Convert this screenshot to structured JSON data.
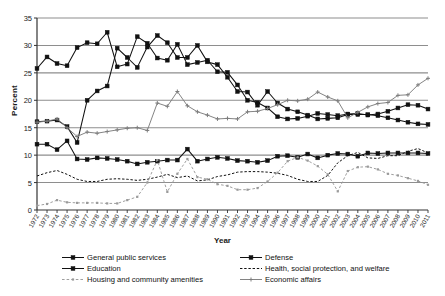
{
  "chart_data": {
    "type": "line",
    "title": "",
    "xlabel": "Year",
    "ylabel": "Percent",
    "ylim": [
      0,
      35
    ],
    "ytick_step": 5,
    "yticks": [
      0,
      5,
      10,
      15,
      20,
      25,
      30,
      35
    ],
    "grid": true,
    "grid_axis": "y",
    "legend_position": "bottom",
    "legend_columns": 2,
    "x": [
      1972,
      1973,
      1974,
      1975,
      1976,
      1977,
      1978,
      1979,
      1980,
      1981,
      1982,
      1983,
      1984,
      1985,
      1986,
      1987,
      1988,
      1989,
      1990,
      1991,
      1992,
      1993,
      1994,
      1995,
      1996,
      1997,
      1998,
      1999,
      2000,
      2001,
      2002,
      2003,
      2004,
      2005,
      2006,
      2007,
      2008,
      2009,
      2010,
      2011
    ],
    "categories": [
      "1972",
      "1973",
      "1974",
      "1975",
      "1976",
      "1977",
      "1978",
      "1979",
      "1980",
      "1981",
      "1982",
      "1983",
      "1984",
      "1985",
      "1986",
      "1987",
      "1988",
      "1989",
      "1990",
      "1991",
      "1992",
      "1993",
      "1994",
      "1995",
      "1996",
      "1997",
      "1998",
      "1999",
      "2000",
      "2001",
      "2002",
      "2003",
      "2004",
      "2005",
      "2006",
      "2007",
      "2008",
      "2009",
      "2010",
      "2011"
    ],
    "series": [
      {
        "name": "General public services",
        "marker": "square",
        "line": "solid",
        "color": "#111111",
        "values": [
          12.0,
          12.0,
          11.0,
          12.6,
          9.3,
          9.2,
          9.5,
          9.4,
          9.2,
          8.9,
          8.4,
          8.7,
          8.9,
          9.1,
          9.1,
          11.1,
          8.9,
          9.3,
          9.6,
          9.4,
          9.0,
          8.9,
          8.7,
          9.0,
          9.8,
          9.9,
          9.6,
          10.2,
          9.5,
          10.0,
          10.3,
          10.2,
          9.8,
          10.4,
          10.3,
          10.4,
          10.4,
          10.4,
          10.4,
          10.3
        ]
      },
      {
        "name": "Defense",
        "marker": "square",
        "line": "solid",
        "color": "#111111",
        "values": [
          25.8,
          27.9,
          26.7,
          26.3,
          29.6,
          30.5,
          30.3,
          32.4,
          26.1,
          26.6,
          31.6,
          30.4,
          27.7,
          27.3,
          30.2,
          26.5,
          26.9,
          27.3,
          25.2,
          25.1,
          22.8,
          20.0,
          19.6,
          18.6,
          17.0,
          16.6,
          16.7,
          17.1,
          17.6,
          17.4,
          17.2,
          17.5,
          17.6,
          17.3,
          17.5,
          18.0,
          18.6,
          19.2,
          19.1,
          18.4
        ]
      },
      {
        "name": "Education",
        "marker": "square",
        "line": "solid",
        "color": "#111111",
        "values": [
          16.1,
          16.2,
          16.4,
          15.2,
          12.3,
          20.0,
          21.7,
          22.6,
          29.5,
          27.8,
          26.0,
          29.7,
          31.8,
          30.5,
          27.8,
          27.8,
          30.0,
          27.0,
          26.5,
          24.2,
          21.6,
          21.5,
          19.1,
          21.6,
          19.5,
          18.4,
          17.9,
          17.3,
          16.6,
          16.7,
          16.8,
          17.4,
          17.4,
          17.4,
          17.2,
          16.8,
          16.4,
          16.0,
          15.7,
          15.6
        ]
      },
      {
        "name": "Health, social protection, and welfare",
        "marker": "none",
        "line": "dashed",
        "color": "#111111",
        "values": [
          6.2,
          6.8,
          7.2,
          6.5,
          5.6,
          5.2,
          5.2,
          5.6,
          5.7,
          5.6,
          5.4,
          5.6,
          6.0,
          6.5,
          5.9,
          6.2,
          5.3,
          5.5,
          6.1,
          6.4,
          6.9,
          7.0,
          7.0,
          6.9,
          6.7,
          6.3,
          5.6,
          5.2,
          5.2,
          6.3,
          8.6,
          9.9,
          10.5,
          9.5,
          9.4,
          9.9,
          9.9,
          10.7,
          11.2,
          10.4
        ]
      },
      {
        "name": "Housing and community amenities",
        "marker": "dot",
        "line": "dashed-light",
        "color": "#9a9a9a",
        "values": [
          0.8,
          1.1,
          1.8,
          1.4,
          1.3,
          1.3,
          1.3,
          1.2,
          1.2,
          1.8,
          2.4,
          5.0,
          9.1,
          3.3,
          6.6,
          9.3,
          6.0,
          5.6,
          4.7,
          4.4,
          3.7,
          3.7,
          4.0,
          5.2,
          6.8,
          8.9,
          9.6,
          9.0,
          8.0,
          6.5,
          3.4,
          7.1,
          7.8,
          7.9,
          7.4,
          6.6,
          6.3,
          5.8,
          5.3,
          4.6
        ]
      },
      {
        "name": "Economic affairs",
        "marker": "cross",
        "line": "solid-light",
        "color": "#7d7d7d",
        "values": [
          16.0,
          16.2,
          16.6,
          15.0,
          13.4,
          14.2,
          14.0,
          14.3,
          14.6,
          14.9,
          15.0,
          14.5,
          19.5,
          18.9,
          21.6,
          19.0,
          17.9,
          17.3,
          16.6,
          16.7,
          16.6,
          17.9,
          18.0,
          18.5,
          19.2,
          20.0,
          19.9,
          20.2,
          21.5,
          20.6,
          19.9,
          16.8,
          17.8,
          18.8,
          19.4,
          19.6,
          20.9,
          21.0,
          22.8,
          24.0
        ]
      }
    ]
  },
  "legend": {
    "items": [
      {
        "label": "General public services",
        "key": "line-square-marker"
      },
      {
        "label": "Defense",
        "key": "line-square-marker"
      },
      {
        "label": "Education",
        "key": "line-square-marker"
      },
      {
        "label": "Health, social protection, and welfare",
        "key": "dashed-line"
      },
      {
        "label": "Housing and community amenities",
        "key": "light-dashed-dot-marker"
      },
      {
        "label": "Economic affairs",
        "key": "light-line-cross-marker"
      }
    ]
  }
}
